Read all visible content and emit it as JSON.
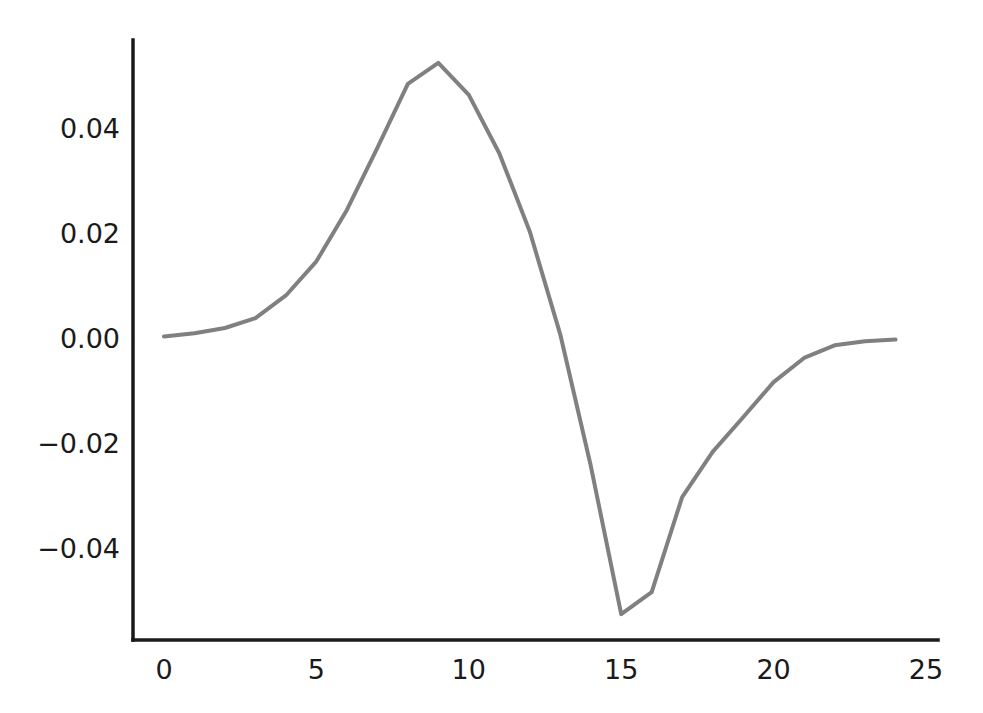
{
  "figure": {
    "background_color": "#ffffff",
    "width": 983,
    "height": 713
  },
  "axes": {
    "spine_color": "#1a1a1a",
    "spine_width": 3.5,
    "plot_left_px": 133,
    "plot_bottom_px": 640,
    "x0_px": 164,
    "x_px_per_unit": 30.48,
    "y0_px": 338,
    "y_px_per_unit": 5250
  },
  "chart_data": {
    "type": "line",
    "title": "",
    "xlabel": "",
    "ylabel": "",
    "xlim": [
      -0.5,
      25.0
    ],
    "ylim": [
      -0.062,
      0.058
    ],
    "grid": false,
    "legend": null,
    "line_color": "#808080",
    "line_width": 4,
    "xticks": [
      0,
      5,
      10,
      15,
      20,
      25
    ],
    "xtick_labels": [
      "0",
      "5",
      "10",
      "15",
      "20",
      "25"
    ],
    "yticks": [
      0.04,
      0.02,
      0.0,
      -0.02,
      -0.04
    ],
    "ytick_labels": [
      "0.04",
      "0.02",
      "0.00",
      "−0.02",
      "−0.04"
    ],
    "series": [
      {
        "name": "signal",
        "x": [
          0,
          1,
          2,
          3,
          4,
          5,
          6,
          7,
          8,
          9,
          10,
          11,
          12,
          13,
          14,
          15,
          16,
          17,
          18,
          19,
          20,
          21,
          22,
          23,
          24
        ],
        "y": [
          0.0003,
          0.0009,
          0.0019,
          0.0038,
          0.0081,
          0.0146,
          0.0244,
          0.0362,
          0.0484,
          0.0524,
          0.0463,
          0.0352,
          0.0203,
          0.0007,
          -0.0243,
          -0.0526,
          -0.0484,
          -0.0303,
          -0.0217,
          -0.0151,
          -0.0084,
          -0.0038,
          -0.0014,
          -0.0006,
          -0.0003
        ]
      }
    ]
  }
}
